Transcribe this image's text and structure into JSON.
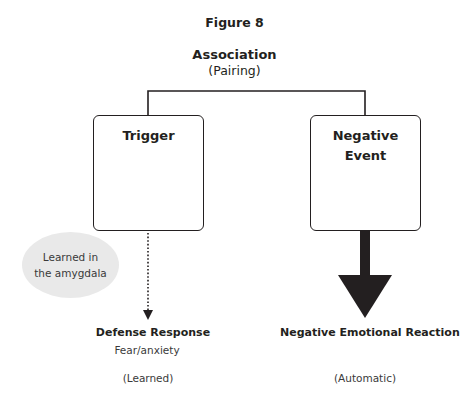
{
  "figure": {
    "title": "Figure 8",
    "association": {
      "title": "Association",
      "subtitle": "(Pairing)"
    },
    "nodes": {
      "trigger": {
        "label": "Trigger"
      },
      "negative_event": {
        "label_line1": "Negative",
        "label_line2": "Event"
      }
    },
    "note": {
      "line1": "Learned in",
      "line2": "the amygdala",
      "fill_color": "#e9e9e9"
    },
    "outcomes": {
      "left": {
        "title": "Defense Response",
        "detail": "Fear/anxiety",
        "type": "(Learned)",
        "arrow_style": "dotted-thin"
      },
      "right": {
        "title": "Negative Emotional Reaction",
        "type": "(Automatic)",
        "arrow_style": "solid-thick"
      }
    },
    "colors": {
      "line": "#231f20",
      "background": "#ffffff"
    }
  }
}
